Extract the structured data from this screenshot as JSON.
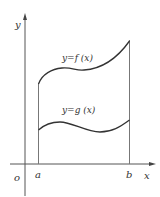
{
  "diagram": {
    "colors": {
      "axis": "#555555",
      "curve": "#333333",
      "boundary": "#777777",
      "text": "#333333"
    },
    "axes": {
      "x_label": "x",
      "y_label": "y",
      "origin_label": "o"
    },
    "bounds": {
      "left_label": "a",
      "right_label": "b"
    },
    "curves": [
      {
        "name": "upper",
        "label": "y=f (x)"
      },
      {
        "name": "lower",
        "label": "y=g (x)"
      }
    ]
  }
}
